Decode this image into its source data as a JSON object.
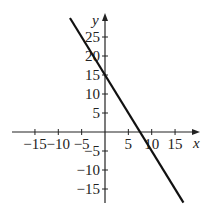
{
  "chart_data": {
    "type": "line",
    "title": "",
    "xlabel": "x",
    "ylabel": "y",
    "xlim": [
      -20,
      20
    ],
    "ylim": [
      -19,
      27
    ],
    "grid": false,
    "x_ticks": [
      -15,
      -10,
      -5,
      5,
      10,
      15
    ],
    "y_ticks": [
      -15,
      -10,
      -5,
      5,
      10,
      15,
      20,
      25
    ],
    "x_tick_labels": [
      "−15",
      "−10",
      "−5",
      "5",
      "10",
      "15"
    ],
    "y_tick_labels": [
      "−15",
      "−10",
      "−5",
      "5",
      "10",
      "15",
      "20",
      "25"
    ],
    "series": [
      {
        "name": "y = -2x + 15",
        "equation": "y = -2x + 15",
        "slope": -2,
        "intercept": 15,
        "x": [
          -7.5,
          0,
          7.5,
          16.5
        ],
        "y": [
          30,
          15,
          0,
          -18
        ],
        "color": "#111111"
      }
    ],
    "legend": null
  },
  "labels": {
    "x_axis": "x",
    "y_axis": "y"
  }
}
